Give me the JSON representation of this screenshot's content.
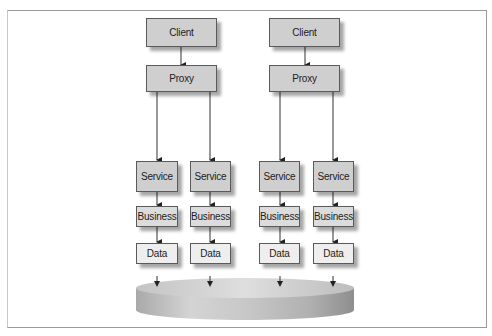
{
  "diagram": {
    "type": "architecture",
    "groups": [
      {
        "client": {
          "label": "Client"
        },
        "proxy": {
          "label": "Proxy"
        },
        "stacks": [
          {
            "service": "Service",
            "business": "Business",
            "data": "Data"
          },
          {
            "service": "Service",
            "business": "Business",
            "data": "Data"
          }
        ]
      },
      {
        "client": {
          "label": "Client"
        },
        "proxy": {
          "label": "Proxy"
        },
        "stacks": [
          {
            "service": "Service",
            "business": "Business",
            "data": "Data"
          },
          {
            "service": "Service",
            "business": "Business",
            "data": "Data"
          }
        ]
      }
    ],
    "database": {
      "shape": "disk",
      "label": ""
    },
    "colors": {
      "tier1": "#cfcfcf",
      "business": "#dcdcdc",
      "data": "#eeeeee",
      "line": "#333333"
    }
  }
}
